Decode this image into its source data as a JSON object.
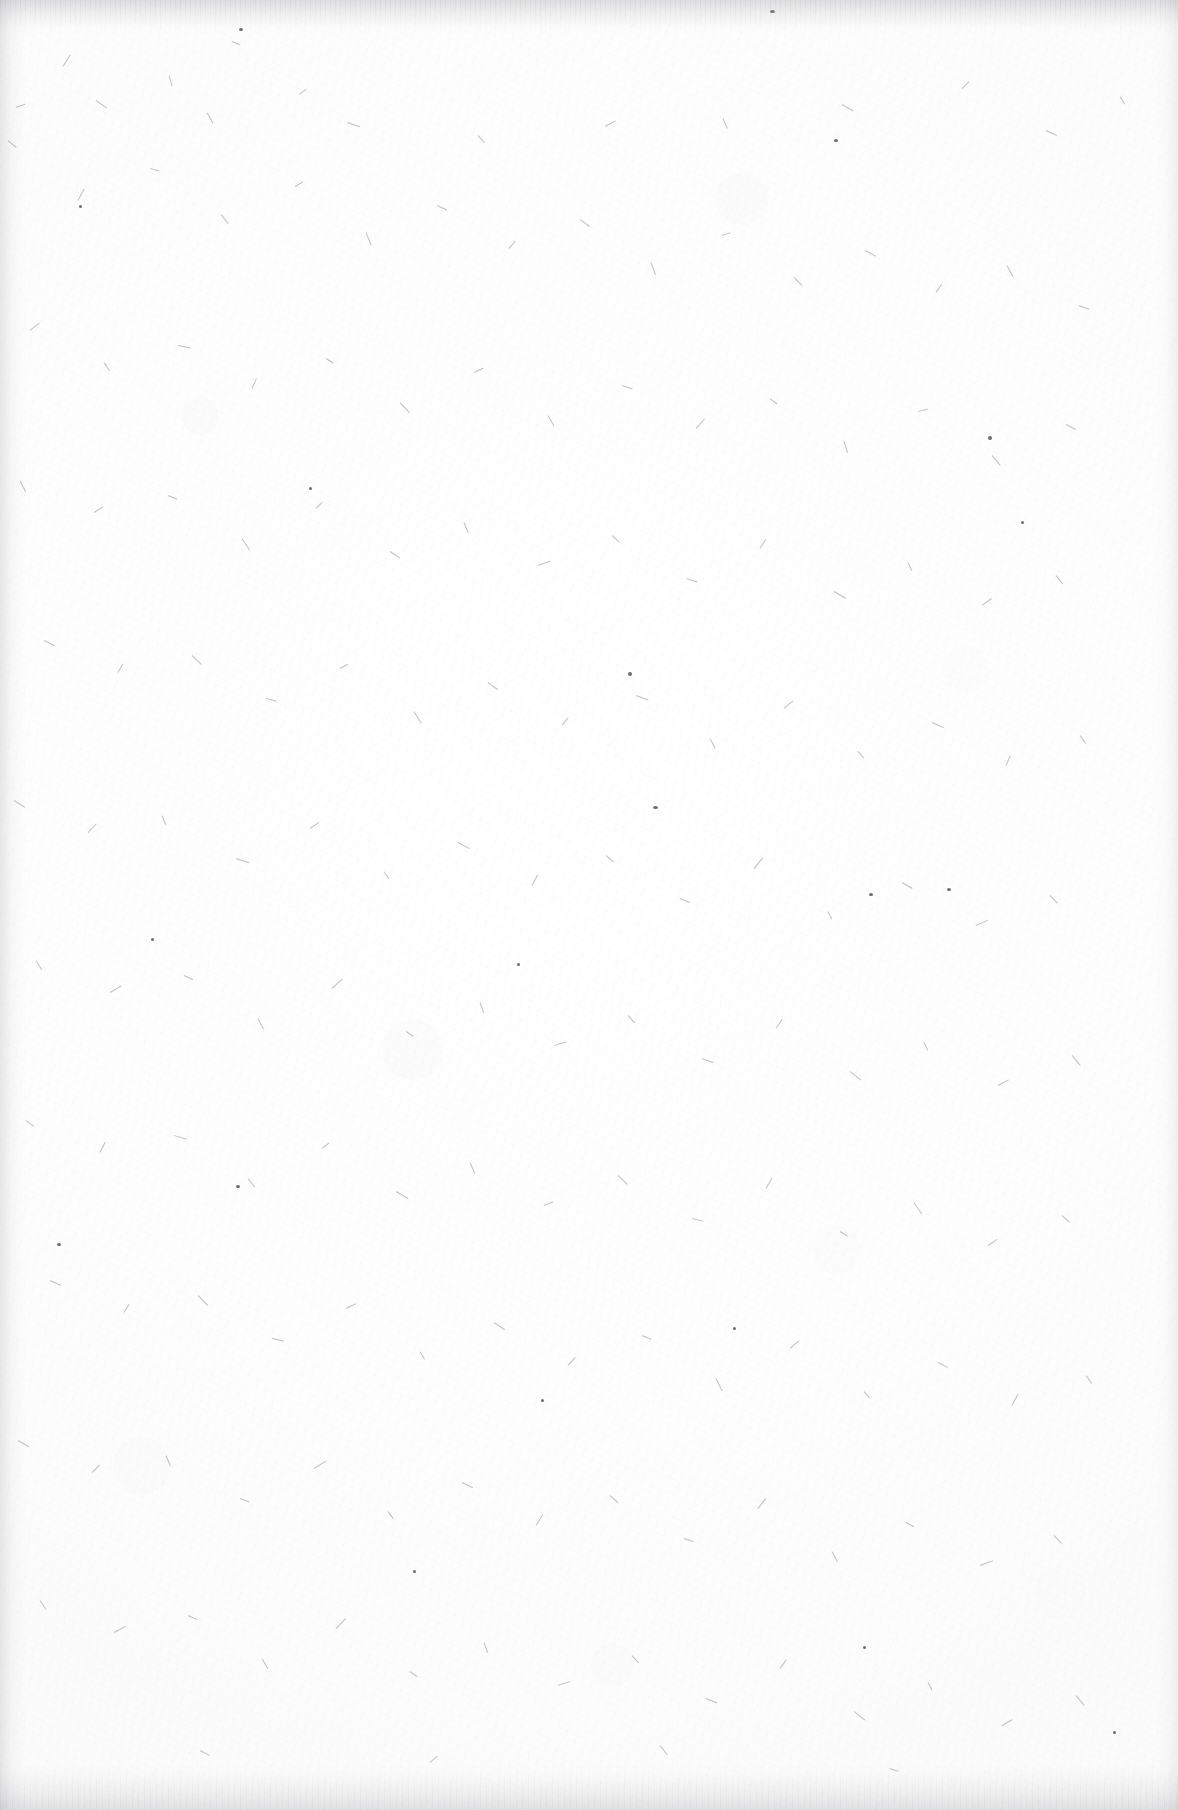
{
  "document": {
    "kind": "scanned-page",
    "content_state": "blank",
    "page_text": "",
    "visible_text_count": 0,
    "has_headings": false,
    "has_page_number": false,
    "has_figures": false,
    "has_tables": false,
    "has_rules_or_lines": false
  },
  "canvas": {
    "width_px": 1178,
    "height_px": 1810,
    "orientation": "portrait"
  },
  "appearance": {
    "paper_color": "#fdfdfd",
    "paper_highlight_color": "#ffffff",
    "paper_shadow_color": "#f6f6f6",
    "fibre_color": "#6c6a72",
    "speck_color": "#48464e",
    "edge_shadow_color": "#96969c",
    "texture": "paper-fibre-speckle"
  },
  "edges": {
    "top": {
      "label": "top scanner shadow band",
      "height_px": 34,
      "streaked": true
    },
    "bottom": {
      "label": "bottom scanner shadow band",
      "height_px": 46,
      "streaked": true
    },
    "left": {
      "label": "left scanner shadow band",
      "width_px": 26,
      "streaked": false
    },
    "right": {
      "label": "right scanner shadow band",
      "width_px": 22,
      "streaked": false
    }
  },
  "fibres": [
    [
      63,
      66,
      14,
      -58
    ],
    [
      232,
      41,
      9,
      22
    ],
    [
      169,
      75,
      11,
      74
    ],
    [
      96,
      100,
      13,
      35
    ],
    [
      16,
      107,
      10,
      -20
    ],
    [
      207,
      112,
      12,
      61
    ],
    [
      299,
      94,
      9,
      -35
    ],
    [
      347,
      122,
      14,
      18
    ],
    [
      478,
      135,
      10,
      48
    ],
    [
      605,
      126,
      12,
      -28
    ],
    [
      723,
      118,
      11,
      66
    ],
    [
      842,
      104,
      13,
      30
    ],
    [
      962,
      88,
      10,
      -44
    ],
    [
      1046,
      130,
      12,
      25
    ],
    [
      1120,
      96,
      9,
      58
    ],
    [
      8,
      140,
      11,
      40
    ],
    [
      78,
      200,
      13,
      -62
    ],
    [
      150,
      168,
      10,
      15
    ],
    [
      221,
      214,
      12,
      52
    ],
    [
      295,
      186,
      9,
      -30
    ],
    [
      366,
      232,
      14,
      68
    ],
    [
      437,
      205,
      11,
      24
    ],
    [
      509,
      248,
      10,
      -50
    ],
    [
      580,
      219,
      12,
      36
    ],
    [
      651,
      262,
      13,
      70
    ],
    [
      722,
      235,
      9,
      -18
    ],
    [
      794,
      277,
      11,
      45
    ],
    [
      865,
      250,
      12,
      28
    ],
    [
      936,
      292,
      10,
      -55
    ],
    [
      1007,
      265,
      13,
      62
    ],
    [
      1079,
      305,
      11,
      20
    ],
    [
      30,
      330,
      12,
      -38
    ],
    [
      104,
      362,
      10,
      55
    ],
    [
      178,
      345,
      13,
      12
    ],
    [
      252,
      388,
      11,
      -66
    ],
    [
      326,
      358,
      9,
      32
    ],
    [
      400,
      402,
      14,
      47
    ],
    [
      474,
      372,
      10,
      -25
    ],
    [
      548,
      415,
      12,
      60
    ],
    [
      622,
      385,
      11,
      18
    ],
    [
      696,
      428,
      13,
      -48
    ],
    [
      770,
      398,
      9,
      38
    ],
    [
      844,
      441,
      12,
      72
    ],
    [
      918,
      411,
      10,
      -14
    ],
    [
      992,
      455,
      13,
      50
    ],
    [
      1066,
      424,
      11,
      27
    ],
    [
      20,
      480,
      13,
      64
    ],
    [
      94,
      512,
      11,
      -32
    ],
    [
      168,
      495,
      10,
      22
    ],
    [
      242,
      538,
      14,
      57
    ],
    [
      316,
      508,
      9,
      -45
    ],
    [
      390,
      551,
      12,
      34
    ],
    [
      464,
      522,
      11,
      68
    ],
    [
      538,
      565,
      13,
      -20
    ],
    [
      612,
      535,
      10,
      42
    ],
    [
      686,
      578,
      12,
      16
    ],
    [
      760,
      548,
      11,
      -58
    ],
    [
      834,
      591,
      14,
      30
    ],
    [
      908,
      562,
      9,
      66
    ],
    [
      982,
      605,
      12,
      -36
    ],
    [
      1056,
      575,
      11,
      52
    ],
    [
      44,
      640,
      12,
      26
    ],
    [
      118,
      672,
      10,
      -60
    ],
    [
      192,
      655,
      13,
      44
    ],
    [
      266,
      698,
      11,
      14
    ],
    [
      340,
      668,
      9,
      -28
    ],
    [
      414,
      711,
      14,
      58
    ],
    [
      488,
      682,
      12,
      36
    ],
    [
      562,
      725,
      10,
      -52
    ],
    [
      636,
      695,
      13,
      20
    ],
    [
      710,
      738,
      11,
      62
    ],
    [
      784,
      708,
      12,
      -40
    ],
    [
      858,
      751,
      9,
      48
    ],
    [
      932,
      722,
      13,
      24
    ],
    [
      1006,
      765,
      11,
      -66
    ],
    [
      1080,
      735,
      10,
      54
    ],
    [
      14,
      800,
      13,
      32
    ],
    [
      88,
      832,
      12,
      -46
    ],
    [
      162,
      815,
      10,
      68
    ],
    [
      236,
      858,
      14,
      18
    ],
    [
      310,
      828,
      11,
      -34
    ],
    [
      384,
      871,
      9,
      56
    ],
    [
      458,
      842,
      13,
      28
    ],
    [
      532,
      885,
      12,
      -62
    ],
    [
      606,
      855,
      10,
      40
    ],
    [
      680,
      898,
      11,
      22
    ],
    [
      754,
      868,
      14,
      -50
    ],
    [
      828,
      911,
      9,
      64
    ],
    [
      902,
      882,
      12,
      30
    ],
    [
      976,
      925,
      13,
      -24
    ],
    [
      1050,
      895,
      11,
      46
    ],
    [
      36,
      960,
      11,
      58
    ],
    [
      110,
      992,
      13,
      -30
    ],
    [
      184,
      975,
      10,
      25
    ],
    [
      258,
      1018,
      12,
      62
    ],
    [
      332,
      988,
      14,
      -42
    ],
    [
      406,
      1031,
      9,
      34
    ],
    [
      480,
      1002,
      11,
      70
    ],
    [
      554,
      1045,
      13,
      -16
    ],
    [
      628,
      1015,
      10,
      48
    ],
    [
      702,
      1058,
      12,
      20
    ],
    [
      776,
      1028,
      11,
      -56
    ],
    [
      850,
      1071,
      14,
      38
    ],
    [
      924,
      1042,
      9,
      64
    ],
    [
      998,
      1085,
      12,
      -28
    ],
    [
      1072,
      1055,
      13,
      50
    ],
    [
      26,
      1120,
      10,
      36
    ],
    [
      100,
      1152,
      12,
      -64
    ],
    [
      174,
      1135,
      13,
      16
    ],
    [
      248,
      1178,
      11,
      52
    ],
    [
      322,
      1148,
      9,
      -38
    ],
    [
      396,
      1191,
      14,
      30
    ],
    [
      470,
      1162,
      12,
      66
    ],
    [
      544,
      1205,
      10,
      -22
    ],
    [
      618,
      1175,
      13,
      44
    ],
    [
      692,
      1218,
      11,
      14
    ],
    [
      766,
      1188,
      12,
      -60
    ],
    [
      840,
      1231,
      9,
      32
    ],
    [
      914,
      1202,
      14,
      56
    ],
    [
      988,
      1245,
      11,
      -34
    ],
    [
      1062,
      1215,
      10,
      42
    ],
    [
      50,
      1280,
      12,
      24
    ],
    [
      124,
      1312,
      10,
      -58
    ],
    [
      198,
      1295,
      14,
      46
    ],
    [
      272,
      1338,
      12,
      12
    ],
    [
      346,
      1308,
      11,
      -26
    ],
    [
      420,
      1351,
      9,
      60
    ],
    [
      494,
      1322,
      13,
      34
    ],
    [
      568,
      1365,
      11,
      -48
    ],
    [
      642,
      1335,
      10,
      22
    ],
    [
      716,
      1378,
      14,
      64
    ],
    [
      790,
      1348,
      12,
      -40
    ],
    [
      864,
      1391,
      9,
      50
    ],
    [
      938,
      1362,
      11,
      26
    ],
    [
      1012,
      1405,
      13,
      -62
    ],
    [
      1086,
      1375,
      10,
      54
    ],
    [
      18,
      1440,
      13,
      30
    ],
    [
      92,
      1472,
      11,
      -44
    ],
    [
      166,
      1455,
      12,
      68
    ],
    [
      240,
      1498,
      10,
      20
    ],
    [
      314,
      1468,
      14,
      -32
    ],
    [
      388,
      1511,
      9,
      54
    ],
    [
      462,
      1482,
      12,
      26
    ],
    [
      536,
      1525,
      13,
      -58
    ],
    [
      610,
      1495,
      11,
      42
    ],
    [
      684,
      1538,
      10,
      18
    ],
    [
      758,
      1508,
      13,
      -52
    ],
    [
      832,
      1551,
      12,
      62
    ],
    [
      906,
      1522,
      9,
      28
    ],
    [
      980,
      1565,
      14,
      -20
    ],
    [
      1054,
      1535,
      11,
      46
    ],
    [
      40,
      1600,
      11,
      56
    ],
    [
      114,
      1632,
      13,
      -28
    ],
    [
      188,
      1615,
      10,
      24
    ],
    [
      262,
      1658,
      12,
      60
    ],
    [
      336,
      1628,
      14,
      -46
    ],
    [
      410,
      1671,
      9,
      36
    ],
    [
      484,
      1642,
      11,
      70
    ],
    [
      558,
      1685,
      13,
      -18
    ],
    [
      632,
      1655,
      10,
      48
    ],
    [
      706,
      1698,
      12,
      22
    ],
    [
      780,
      1668,
      11,
      -54
    ],
    [
      854,
      1711,
      14,
      38
    ],
    [
      928,
      1682,
      9,
      62
    ],
    [
      1002,
      1725,
      12,
      -30
    ],
    [
      1076,
      1695,
      13,
      50
    ],
    [
      200,
      1750,
      11,
      28
    ],
    [
      430,
      1762,
      10,
      -40
    ],
    [
      660,
      1745,
      12,
      52
    ],
    [
      890,
      1768,
      9,
      18
    ]
  ],
  "specks": [
    [
      239,
      28,
      4,
      3
    ],
    [
      770,
      10,
      5,
      3
    ],
    [
      834,
      139,
      4,
      3
    ],
    [
      988,
      436,
      4,
      4
    ],
    [
      628,
      672,
      4,
      4
    ],
    [
      653,
      806,
      5,
      3
    ],
    [
      869,
      893,
      4,
      3
    ],
    [
      947,
      888,
      4,
      3
    ],
    [
      57,
      1243,
      4,
      3
    ],
    [
      236,
      1185,
      4,
      3
    ],
    [
      1021,
      521,
      3,
      3
    ],
    [
      79,
      205,
      3,
      3
    ],
    [
      309,
      487,
      3,
      3
    ],
    [
      517,
      963,
      3,
      3
    ],
    [
      733,
      1327,
      3,
      3
    ],
    [
      413,
      1570,
      3,
      3
    ],
    [
      1113,
      1731,
      3,
      3
    ],
    [
      151,
      938,
      3,
      3
    ],
    [
      863,
      1646,
      3,
      3
    ],
    [
      541,
      1399,
      3,
      3
    ]
  ]
}
